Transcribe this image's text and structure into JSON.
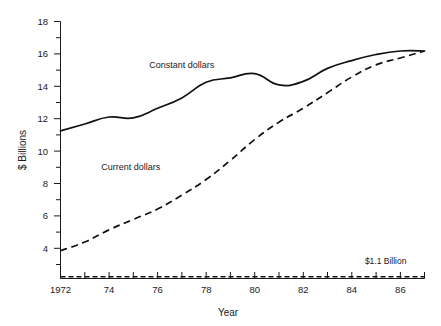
{
  "chart_data": {
    "type": "line",
    "title": "",
    "xlabel": "Year",
    "ylabel": "$ Billions",
    "xlim": [
      1972,
      1987
    ],
    "ylim": [
      3.2,
      18
    ],
    "grid": false,
    "legend": "inline-annotations",
    "x": [
      1972,
      1973,
      1974,
      1975,
      1976,
      1977,
      1978,
      1979,
      1980,
      1981,
      1982,
      1983,
      1984,
      1985,
      1986,
      1987
    ],
    "series": [
      {
        "name": "Constant dollars",
        "style": "solid",
        "values": [
          11.7,
          12.1,
          12.5,
          12.45,
          13.0,
          13.6,
          14.5,
          14.75,
          15.0,
          14.35,
          14.55,
          15.3,
          15.75,
          16.1,
          16.3,
          16.3
        ]
      },
      {
        "name": "Current dollars",
        "style": "dashed",
        "values": [
          4.8,
          5.3,
          6.0,
          6.6,
          7.2,
          8.0,
          8.9,
          10.0,
          11.2,
          12.2,
          13.0,
          13.9,
          14.8,
          15.5,
          15.9,
          16.3
        ]
      },
      {
        "name": "$1.1 Billion",
        "style": "dashed-flat",
        "values": [
          3.3,
          3.3,
          3.3,
          3.3,
          3.3,
          3.3,
          3.3,
          3.3,
          3.3,
          3.3,
          3.3,
          3.3,
          3.3,
          3.3,
          3.3,
          3.3
        ]
      }
    ],
    "yticks": [
      4,
      6,
      8,
      10,
      12,
      14,
      16,
      18
    ],
    "yticks_minor": [
      5,
      7,
      9,
      11,
      13,
      15,
      17
    ],
    "xticks": [
      1972,
      1974,
      1976,
      1978,
      1980,
      1982,
      1984,
      1986
    ],
    "xtick_labels": [
      "1972",
      "74",
      "76",
      "78",
      "80",
      "82",
      "84",
      "86"
    ],
    "annotations": [
      {
        "text": "Constant dollars",
        "x": 1977.0,
        "y": 15.35
      },
      {
        "text": "Current dollars",
        "x": 1974.9,
        "y": 9.45
      },
      {
        "text": "$1.1 Billion",
        "x": 1985.4,
        "y": 4.05
      }
    ]
  },
  "axes": {
    "y_title": "$ Billions",
    "x_title": "Year",
    "y_tick_labels": [
      "4",
      "6",
      "8",
      "10",
      "12",
      "14",
      "16",
      "18"
    ],
    "x_tick_labels": [
      "1972",
      "74",
      "76",
      "78",
      "80",
      "82",
      "84",
      "86"
    ]
  },
  "labels": {
    "constant_dollars": "Constant dollars",
    "current_dollars": "Current dollars",
    "baseline_value": "$1.1 Billion"
  }
}
